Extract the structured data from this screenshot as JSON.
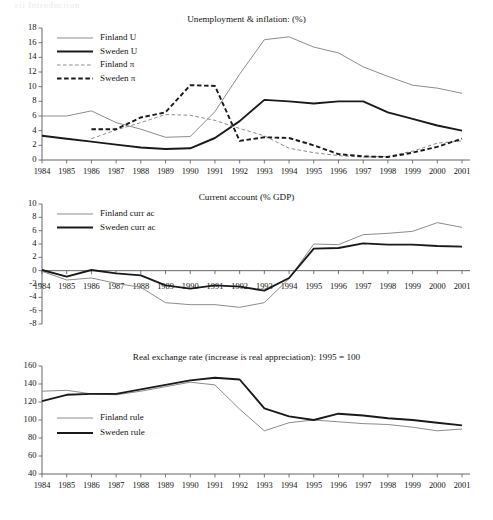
{
  "header": {
    "running_head": "xii   Introduction"
  },
  "figure": {
    "x_years": [
      1984,
      1985,
      1986,
      1987,
      1988,
      1989,
      1990,
      1991,
      1992,
      1993,
      1994,
      1995,
      1996,
      1997,
      1998,
      1999,
      2000,
      2001
    ],
    "colors": {
      "finland": "#8c8c8c",
      "sweden": "#1a1a1a",
      "axis": "#555555"
    }
  },
  "chart_data": [
    {
      "type": "line",
      "title": "Unemployment & inflation: (%)",
      "xlabel": "",
      "ylabel": "",
      "ylim": [
        0,
        18
      ],
      "yticks": [
        0,
        2,
        4,
        6,
        8,
        10,
        12,
        14,
        16,
        18
      ],
      "grid": false,
      "legend_position": "top-left",
      "categories": [
        1984,
        1985,
        1986,
        1987,
        1988,
        1989,
        1990,
        1991,
        1992,
        1993,
        1994,
        1995,
        1996,
        1997,
        1998,
        1999,
        2000,
        2001
      ],
      "series": [
        {
          "name": "Finland U",
          "style": "solid",
          "color": "#8c8c8c",
          "width": 1.0,
          "values": [
            6.0,
            6.0,
            6.7,
            5.1,
            4.2,
            3.1,
            3.2,
            6.6,
            11.7,
            16.4,
            16.8,
            15.4,
            14.6,
            12.7,
            11.4,
            10.2,
            9.8,
            9.1
          ]
        },
        {
          "name": "Sweden U",
          "style": "solid",
          "color": "#1a1a1a",
          "width": 1.9,
          "values": [
            3.3,
            2.9,
            2.5,
            2.1,
            1.7,
            1.5,
            1.6,
            3.0,
            5.3,
            8.2,
            8.0,
            7.7,
            8.0,
            8.0,
            6.5,
            5.6,
            4.7,
            4.0
          ]
        },
        {
          "name": "Finland π",
          "style": "dashed",
          "color": "#8c8c8c",
          "width": 1.0,
          "values": [
            null,
            null,
            2.9,
            4.1,
            5.1,
            6.2,
            6.1,
            5.4,
            4.3,
            3.3,
            1.6,
            1.0,
            0.6,
            0.4,
            0.5,
            1.2,
            2.3,
            2.6
          ]
        },
        {
          "name": "Sweden π",
          "style": "dashed",
          "color": "#1a1a1a",
          "width": 1.9,
          "values": [
            null,
            null,
            4.2,
            4.2,
            5.8,
            6.5,
            10.2,
            10.1,
            2.6,
            3.1,
            3.0,
            2.0,
            0.8,
            0.5,
            0.4,
            1.0,
            1.8,
            2.9
          ]
        }
      ]
    },
    {
      "type": "line",
      "title": "Current account (% GDP)",
      "xlabel": "",
      "ylabel": "",
      "ylim": [
        -8,
        10
      ],
      "yticks": [
        -8,
        -6,
        -4,
        -2,
        0,
        2,
        4,
        6,
        8,
        10
      ],
      "grid": false,
      "legend_position": "top-left",
      "categories": [
        1984,
        1985,
        1986,
        1987,
        1988,
        1989,
        1990,
        1991,
        1992,
        1993,
        1994,
        1995,
        1996,
        1997,
        1998,
        1999,
        2000,
        2001
      ],
      "series": [
        {
          "name": "Finland curr ac",
          "style": "solid",
          "color": "#8c8c8c",
          "width": 1.0,
          "values": [
            -0.1,
            -1.4,
            -1.1,
            -1.9,
            -2.5,
            -4.8,
            -5.1,
            -5.1,
            -5.5,
            -4.8,
            -1.2,
            4.0,
            3.9,
            5.4,
            5.6,
            5.9,
            7.2,
            6.5
          ]
        },
        {
          "name": "Sweden curr ac",
          "style": "solid",
          "color": "#1a1a1a",
          "width": 1.9,
          "values": [
            0.1,
            -0.9,
            0.1,
            -0.4,
            -0.7,
            -2.2,
            -2.7,
            -2.2,
            -2.4,
            -3.0,
            -1.1,
            3.3,
            3.4,
            4.1,
            3.9,
            3.9,
            3.7,
            3.6
          ]
        }
      ]
    },
    {
      "type": "line",
      "title": "Real exchange rate (increase is real appreciation): 1995 = 100",
      "xlabel": "",
      "ylabel": "",
      "ylim": [
        40,
        160
      ],
      "yticks": [
        40,
        60,
        80,
        100,
        120,
        140,
        160
      ],
      "grid": false,
      "legend_position": "center-left",
      "categories": [
        1984,
        1985,
        1986,
        1987,
        1988,
        1989,
        1990,
        1991,
        1992,
        1993,
        1994,
        1995,
        1996,
        1997,
        1998,
        1999,
        2000,
        2001
      ],
      "series": [
        {
          "name": "Finland rule",
          "style": "solid",
          "color": "#8c8c8c",
          "width": 1.0,
          "values": [
            132,
            133,
            129,
            128,
            132,
            137,
            142,
            139,
            112,
            88,
            97,
            100,
            98,
            96,
            95,
            92,
            88,
            90
          ]
        },
        {
          "name": "Sweden rule",
          "style": "solid",
          "color": "#1a1a1a",
          "width": 1.9,
          "values": [
            121,
            128,
            129,
            129,
            134,
            139,
            144,
            147,
            145,
            113,
            104,
            100,
            107,
            105,
            102,
            100,
            97,
            94
          ]
        }
      ]
    }
  ]
}
